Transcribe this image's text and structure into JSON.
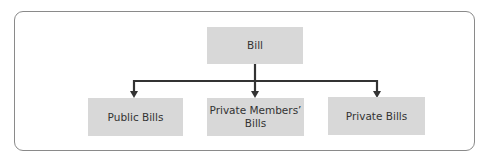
{
  "diagram": {
    "type": "hierarchy",
    "root": {
      "label": "Bill"
    },
    "children": [
      {
        "label": "Public Bills"
      },
      {
        "label": "Private Members' Bills",
        "lines": [
          "Private Members’",
          "Bills"
        ]
      },
      {
        "label": "Private Bills"
      }
    ]
  },
  "colors": {
    "box_fill": "#d8d8d8",
    "connector": "#333333",
    "frame": "#8a8a8a"
  }
}
